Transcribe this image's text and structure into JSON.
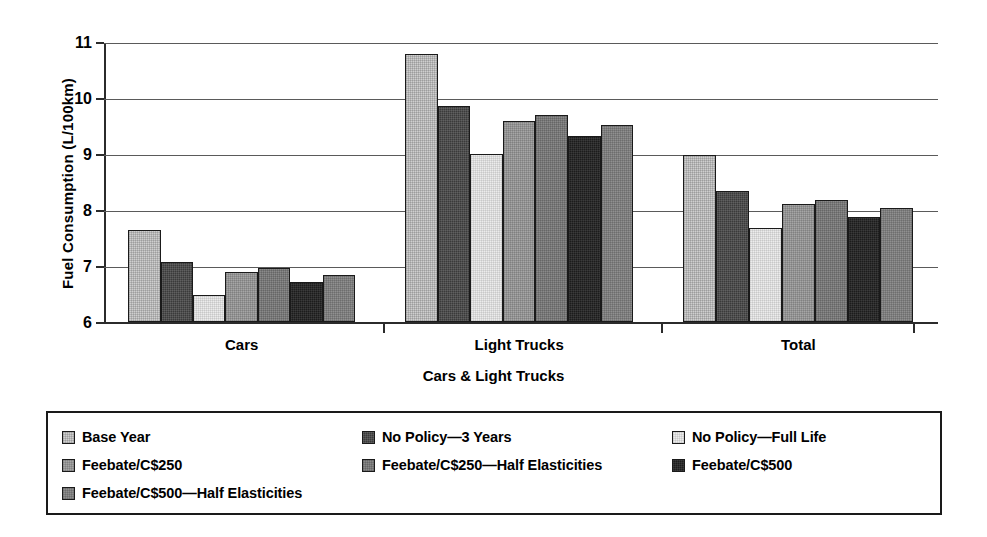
{
  "chart_data": {
    "type": "bar",
    "title": "",
    "xlabel": "Cars & Light Trucks",
    "ylabel": "Fuel Consumption (L/100km)",
    "ylim": [
      6,
      11
    ],
    "yticks": [
      6,
      7,
      8,
      9,
      10,
      11
    ],
    "ytick_labels": [
      "6",
      "7",
      "8",
      "9",
      "10",
      "11"
    ],
    "grid": true,
    "legend_position": "bottom",
    "categories": [
      "Cars",
      "Light Trucks",
      "Total"
    ],
    "series": [
      {
        "name": "Base Year",
        "swatch": "sw-1",
        "color": "#cfcfcf",
        "values": [
          7.64,
          10.78,
          8.98
        ]
      },
      {
        "name": "No Policy—3 Years",
        "swatch": "sw-2",
        "color": "#3a3a3a",
        "values": [
          7.07,
          9.85,
          8.34
        ]
      },
      {
        "name": "No Policy—Full Life",
        "swatch": "sw-3",
        "color": "#ececec",
        "values": [
          6.48,
          9.0,
          7.67
        ]
      },
      {
        "name": "Feebate/C$250",
        "swatch": "sw-4",
        "color": "#a6a6a6",
        "values": [
          6.9,
          9.59,
          8.1
        ]
      },
      {
        "name": "Feebate/C$250—Half Elasticities",
        "swatch": "sw-5",
        "color": "#8a8a8a",
        "values": [
          6.96,
          9.7,
          8.18
        ]
      },
      {
        "name": "Feebate/C$500",
        "swatch": "sw-6",
        "color": "#1c1c1c",
        "values": [
          6.71,
          9.32,
          7.88
        ]
      },
      {
        "name": "Feebate/C$500—Half Elasticities",
        "swatch": "sw-7",
        "color": "#909090",
        "values": [
          6.84,
          9.52,
          8.03
        ]
      }
    ]
  },
  "legend": {
    "rows": [
      [
        {
          "label": "Base Year",
          "swatch": "sw-1"
        },
        {
          "label": "No Policy—3 Years",
          "swatch": "sw-2"
        },
        {
          "label": "No Policy—Full Life",
          "swatch": "sw-3"
        }
      ],
      [
        {
          "label": "Feebate/C$250",
          "swatch": "sw-4"
        },
        {
          "label": "Feebate/C$250—Half Elasticities",
          "swatch": "sw-5"
        },
        {
          "label": "Feebate/C$500",
          "swatch": "sw-6"
        }
      ],
      [
        {
          "label": "Feebate/C$500—Half Elasticities",
          "swatch": "sw-7"
        }
      ]
    ]
  }
}
